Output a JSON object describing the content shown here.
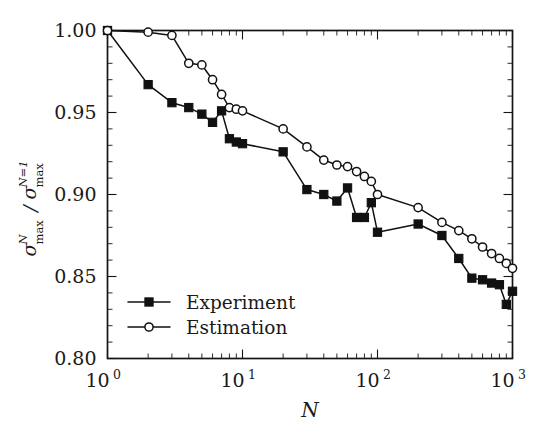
{
  "chart_data": {
    "type": "line",
    "title": "",
    "xlabel": "N",
    "ylabel_parts": {
      "numer_base": "σ",
      "numer_sub": "max",
      "numer_sup": "N",
      "divider": "/",
      "denom_base": "σ",
      "denom_sub": "max",
      "denom_sup": "N=1"
    },
    "xscale": "log",
    "yscale": "linear",
    "xlim": [
      1,
      1000
    ],
    "ylim": [
      0.8,
      1.0
    ],
    "grid": false,
    "legend_position": "lower-left",
    "x_tick_labels": [
      "10",
      "10",
      "10",
      "10"
    ],
    "x_tick_exponents": [
      "0",
      "1",
      "2",
      "3"
    ],
    "x_tick_values": [
      1,
      10,
      100,
      1000
    ],
    "y_tick_labels": [
      "1.00",
      "0.95",
      "0.90",
      "0.85",
      "0.80"
    ],
    "y_tick_values": [
      1.0,
      0.95,
      0.9,
      0.85,
      0.8
    ],
    "series": [
      {
        "name": "Experiment",
        "marker": "filled-square",
        "x": [
          1,
          2,
          3,
          4,
          5,
          6,
          7,
          8,
          9,
          10,
          20,
          30,
          40,
          50,
          60,
          70,
          80,
          90,
          100,
          200,
          300,
          400,
          500,
          600,
          700,
          800,
          900,
          1000
        ],
        "values": [
          1.0,
          0.967,
          0.956,
          0.953,
          0.949,
          0.944,
          0.951,
          0.934,
          0.932,
          0.931,
          0.926,
          0.903,
          0.9,
          0.896,
          0.904,
          0.886,
          0.886,
          0.895,
          0.877,
          0.882,
          0.875,
          0.861,
          0.849,
          0.848,
          0.846,
          0.845,
          0.833,
          0.841
        ]
      },
      {
        "name": "Estimation",
        "marker": "open-circle",
        "x": [
          1,
          2,
          3,
          4,
          5,
          6,
          7,
          8,
          9,
          10,
          20,
          30,
          40,
          50,
          60,
          70,
          80,
          90,
          100,
          200,
          300,
          400,
          500,
          600,
          700,
          800,
          900,
          1000
        ],
        "values": [
          1.0,
          0.999,
          0.997,
          0.98,
          0.979,
          0.97,
          0.961,
          0.953,
          0.952,
          0.951,
          0.94,
          0.929,
          0.921,
          0.918,
          0.917,
          0.914,
          0.911,
          0.908,
          0.9,
          0.892,
          0.883,
          0.878,
          0.873,
          0.868,
          0.864,
          0.861,
          0.858,
          0.855
        ]
      }
    ]
  },
  "legend": {
    "items": [
      {
        "label": "Experiment",
        "marker": "filled-square"
      },
      {
        "label": "Estimation",
        "marker": "open-circle"
      }
    ]
  }
}
